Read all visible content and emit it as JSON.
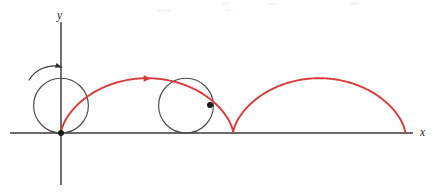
{
  "figure": {
    "name": "cycloid-diagram",
    "background_color": "#fefefe"
  },
  "axes": {
    "x_axis": {
      "label": "x",
      "label_position": {
        "x": 420,
        "y": 136
      },
      "start": {
        "x": 10,
        "y": 133
      },
      "end": {
        "x": 413,
        "y": 133
      },
      "color": "#6b6b6b"
    },
    "y_axis": {
      "label": "y",
      "label_position": {
        "x": 57,
        "y": 19
      },
      "start": {
        "x": 61,
        "y": 22
      },
      "end": {
        "x": 61,
        "y": 185
      },
      "color": "#6b6b6b"
    },
    "origin": {
      "x": 61,
      "y": 133
    }
  },
  "chart_data": {
    "type": "line",
    "title": "",
    "xlabel": "x",
    "ylabel": "y",
    "curve_name": "cycloid",
    "curve_color": "#d43b3b",
    "curve_width": 1.9,
    "radius_px": 27.4,
    "arch_count": 2,
    "arch_span_px": 172.2,
    "arch_height_px": 54.8,
    "cusp_points": [
      {
        "x": 61,
        "y": 133
      },
      {
        "x": 233,
        "y": 133
      },
      {
        "x": 405,
        "y": 133
      }
    ],
    "peak_points": [
      {
        "x": 147,
        "y": 78
      },
      {
        "x": 319,
        "y": 78
      }
    ],
    "parametric": {
      "x": "r(t - sin t)",
      "y": "r(1 - cos t)",
      "t_range": [
        0,
        12.566370614359172
      ]
    }
  },
  "rolling_circles": [
    {
      "id": "circle-start",
      "center": {
        "x": 61,
        "y": 105.6
      },
      "radius": 27.4,
      "stroke": "#4a4a4a",
      "tracing_point": {
        "x": 61,
        "y": 133
      },
      "t_param": 0
    },
    {
      "id": "circle-mid",
      "center": {
        "x": 186,
        "y": 105.6
      },
      "radius": 27.4,
      "stroke": "#4a4a4a",
      "tracing_point": {
        "x": 210,
        "y": 105
      },
      "t_param": 4.56
    }
  ],
  "markers": {
    "origin_dot": {
      "x": 61,
      "y": 133,
      "r": 3.0,
      "color": "#1a1a1a"
    },
    "mid_dot": {
      "x": 210,
      "y": 105,
      "r": 3.0,
      "color": "#1a1a1a"
    }
  },
  "annotations": {
    "rotation_arrow": {
      "name": "rotation-direction-arrow",
      "meaning": "circle rolls clockwise",
      "path": "M 29,80 A 30 30 0 0 1 58,66",
      "head": {
        "x": 58,
        "y": 66,
        "angle_deg": 20
      },
      "color": "#2e2e2e"
    },
    "travel_arrow": {
      "name": "curve-direction-arrow",
      "meaning": "point travels to the right along cycloid",
      "position": {
        "x": 146,
        "y": 78.5
      },
      "angle_deg": 0,
      "color": "#d43b3b"
    }
  }
}
